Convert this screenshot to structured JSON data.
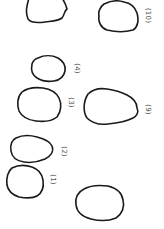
{
  "figure": {
    "background": "#ffffff",
    "stroke_color": "#1a1a1a",
    "label_color": "#555555",
    "label_orientation": "rotated 90 degrees clockwise",
    "shapes": [
      {
        "id": "unlabeled-top",
        "label": ""
      },
      {
        "id": "shape-10",
        "label": "(10)"
      },
      {
        "id": "shape-4",
        "label": "(4)"
      },
      {
        "id": "shape-3",
        "label": "(3)"
      },
      {
        "id": "shape-9",
        "label": "(9)"
      },
      {
        "id": "shape-2",
        "label": "(2)"
      },
      {
        "id": "shape-1",
        "label": "(1)"
      },
      {
        "id": "unlabeled-bottom",
        "label": ""
      }
    ]
  }
}
